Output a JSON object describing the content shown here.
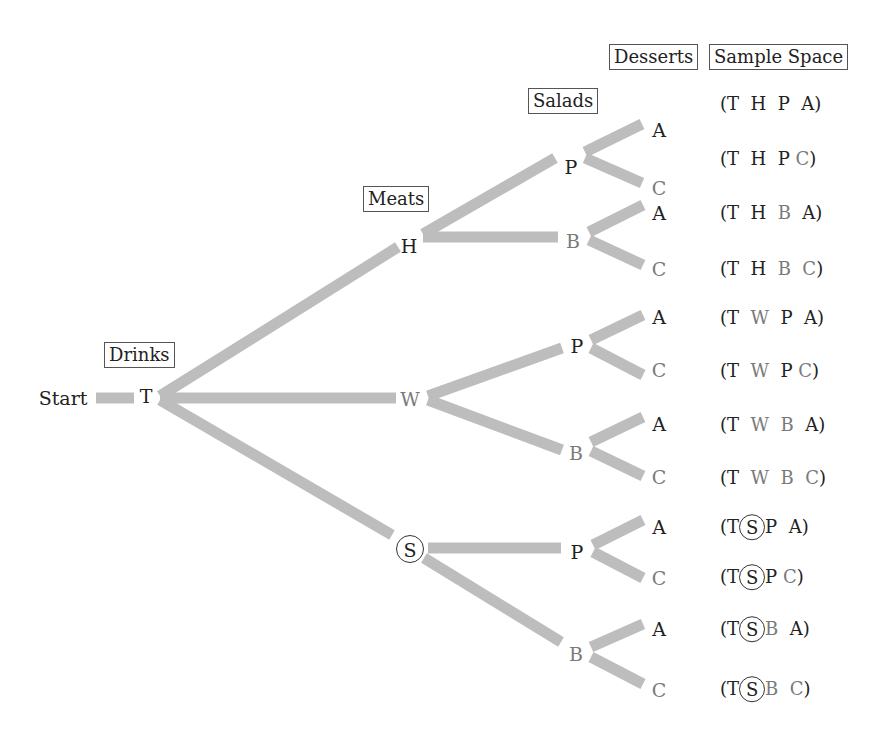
{
  "headers": {
    "drinks": "Drinks",
    "meats": "Meats",
    "salads": "Salads",
    "desserts": "Desserts",
    "sample_space": "Sample Space"
  },
  "colors": {
    "branch": "#bdbdbd",
    "text_dark": "#222222",
    "text_gray": "#7a7a7a",
    "box_border": "#555555"
  },
  "nodes": {
    "start": "Start",
    "drink": "T",
    "meats": [
      "H",
      "W",
      "S"
    ],
    "salads": [
      "P",
      "B",
      "P",
      "B",
      "P",
      "B"
    ],
    "desserts": [
      "A",
      "C",
      "A",
      "C",
      "A",
      "C",
      "A",
      "C",
      "A",
      "C",
      "A",
      "C"
    ]
  },
  "circled_node": "S",
  "sample_space": [
    [
      "T",
      "H",
      "P",
      "A"
    ],
    [
      "T",
      "H",
      "P",
      "C"
    ],
    [
      "T",
      "H",
      "B",
      "A"
    ],
    [
      "T",
      "H",
      "B",
      "C"
    ],
    [
      "T",
      "W",
      "P",
      "A"
    ],
    [
      "T",
      "W",
      "P",
      "C"
    ],
    [
      "T",
      "W",
      "B",
      "A"
    ],
    [
      "T",
      "W",
      "B",
      "C"
    ],
    [
      "T",
      "S",
      "P",
      "A"
    ],
    [
      "T",
      "S",
      "P",
      "C"
    ],
    [
      "T",
      "S",
      "B",
      "A"
    ],
    [
      "T",
      "S",
      "B",
      "C"
    ]
  ]
}
